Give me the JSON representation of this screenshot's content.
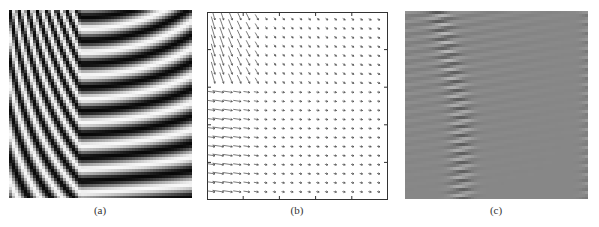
{
  "figure": {
    "panels": [
      {
        "id": "a",
        "label": "(a)",
        "description": "fringe-pattern",
        "type": "grayscale-fringe-image"
      },
      {
        "id": "b",
        "label": "(b)",
        "description": "vector-field-quiver-plot",
        "type": "quiver-plot",
        "grid": "20x20",
        "axes_ticks": {
          "x": 5,
          "y": 5
        }
      },
      {
        "id": "c",
        "label": "(c)",
        "description": "residual-fringe-pattern",
        "type": "grayscale-residual-image"
      }
    ]
  }
}
